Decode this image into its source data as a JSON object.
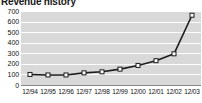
{
  "chart_data": {
    "type": "line",
    "title": "Revenue history",
    "xlabel": "",
    "ylabel": "",
    "categories": [
      "12/94",
      "12/95",
      "12/96",
      "12/97",
      "12/98",
      "12/99",
      "12/00",
      "12/01",
      "12/02",
      "12/03"
    ],
    "series": [
      {
        "name": "Revenue",
        "values": [
          100,
          95,
          95,
          115,
          125,
          150,
          185,
          230,
          295,
          660
        ]
      }
    ],
    "ylim": [
      0,
      700
    ],
    "ytick_labels": [
      "700",
      "600",
      "500",
      "400",
      "300",
      "200",
      "100",
      "0"
    ],
    "ytick_values": [
      700,
      600,
      500,
      400,
      300,
      200,
      100,
      0
    ],
    "grid": true,
    "legend": "none",
    "colors": {
      "plot_background": "#d9d9d9",
      "gridline": "#ffffff",
      "line": "#1c1c1c",
      "marker_fill": "#ffffff",
      "marker_stroke": "#1c1c1c",
      "axis": "#8a8a8a",
      "text": "#111111",
      "title": "#1a1a1a",
      "page_background": "#ffffff"
    }
  }
}
